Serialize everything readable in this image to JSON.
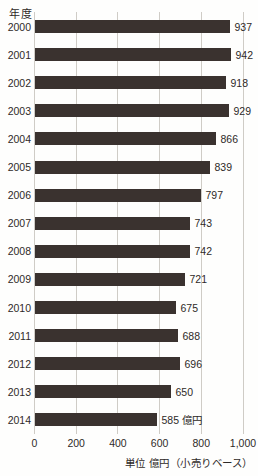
{
  "chart": {
    "y_axis_title": "年度",
    "footnote": "単位 億円（小売りベース）",
    "colors": {
      "bar": "#3a322f",
      "gridline": "#cfccc6",
      "text": "#2e2a28",
      "background": "#fefefd"
    }
  },
  "chart_data": {
    "type": "bar",
    "orientation": "horizontal",
    "title": "",
    "ylabel": "年度",
    "xlabel": "単位 億円（小売りベース）",
    "categories": [
      "2000",
      "2001",
      "2002",
      "2003",
      "2004",
      "2005",
      "2006",
      "2007",
      "2008",
      "2009",
      "2010",
      "2011",
      "2012",
      "2013",
      "2014"
    ],
    "values": [
      937,
      942,
      918,
      929,
      866,
      839,
      797,
      743,
      742,
      721,
      675,
      688,
      696,
      650,
      585
    ],
    "value_labels": [
      "937",
      "942",
      "918",
      "929",
      "866",
      "839",
      "797",
      "743",
      "742",
      "721",
      "675",
      "688",
      "696",
      "650",
      "585 億円"
    ],
    "unit": "億円",
    "xlim": [
      0,
      1000
    ],
    "x_ticks": [
      0,
      200,
      400,
      600,
      800,
      1000
    ],
    "x_tick_labels": [
      "0",
      "200",
      "400",
      "600",
      "800",
      "1,000"
    ],
    "grid": true,
    "legend": false
  }
}
